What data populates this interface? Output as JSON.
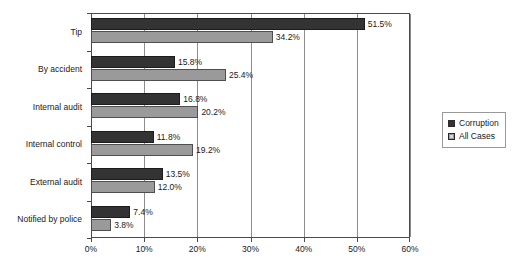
{
  "chart_data": {
    "type": "bar",
    "orientation": "horizontal",
    "title": "",
    "subtitle": "",
    "xlabel": "",
    "ylabel": "",
    "xlim": [
      0,
      60
    ],
    "xtick_labels": [
      "0%",
      "10%",
      "20%",
      "30%",
      "40%",
      "50%",
      "60%"
    ],
    "xtick_values": [
      0,
      10,
      20,
      30,
      40,
      50,
      60
    ],
    "grid": true,
    "grid_axis": "x",
    "legend_position": "right",
    "value_suffix": "%",
    "categories": [
      "Tip",
      "By accident",
      "Internal audit",
      "Internal control",
      "External audit",
      "Notified by police"
    ],
    "series": [
      {
        "name": "Corruption",
        "color": "#333333",
        "values": [
          51.5,
          15.8,
          16.8,
          11.8,
          13.5,
          7.4
        ],
        "labels": [
          "51.5%",
          "15.8%",
          "16.8%",
          "11.8%",
          "13.5%",
          "7.4%"
        ]
      },
      {
        "name": "All Cases",
        "color": "#9a9a9a",
        "values": [
          34.2,
          25.4,
          20.2,
          19.2,
          12.0,
          3.8
        ],
        "labels": [
          "34.2%",
          "25.4%",
          "20.2%",
          "19.2%",
          "12.0%",
          "3.8%"
        ]
      }
    ]
  },
  "legend": {
    "items": [
      {
        "label": "Corruption",
        "swatch": "series-corruption"
      },
      {
        "label": "All Cases",
        "swatch": "series-allcases"
      }
    ]
  }
}
